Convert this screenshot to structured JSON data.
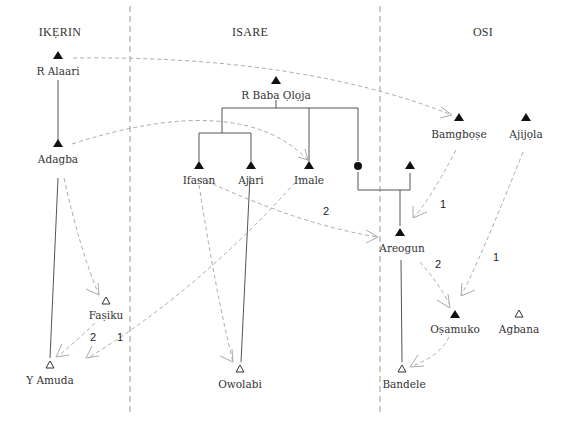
{
  "columns": [
    {
      "id": "ikerin",
      "label": "IKẸRIN"
    },
    {
      "id": "isare",
      "label": "ISARE"
    },
    {
      "id": "osi",
      "label": "OSI"
    }
  ],
  "nodes": [
    {
      "id": "r-alaari",
      "label": "R Alaari",
      "symbol": "filled-triangle",
      "column": "ikerin"
    },
    {
      "id": "adagba",
      "label": "Adagba",
      "symbol": "filled-triangle",
      "column": "ikerin"
    },
    {
      "id": "fasiku",
      "label": "Faṣiku",
      "symbol": "open-triangle",
      "column": "ikerin"
    },
    {
      "id": "y-amuda",
      "label": "Y Amuda",
      "symbol": "open-triangle",
      "column": "ikerin"
    },
    {
      "id": "r-baba-oloja",
      "label": "R Baba Ọlọja",
      "symbol": "filled-triangle",
      "column": "isare"
    },
    {
      "id": "ifasan",
      "label": "Ifasan",
      "symbol": "filled-triangle",
      "column": "isare"
    },
    {
      "id": "ajari",
      "label": "Ajari",
      "symbol": "filled-triangle",
      "column": "isare"
    },
    {
      "id": "imale",
      "label": "Imale",
      "symbol": "filled-triangle",
      "column": "isare"
    },
    {
      "id": "female",
      "label": "",
      "symbol": "filled-circle",
      "column": "isare"
    },
    {
      "id": "owolabi",
      "label": "Owolabi",
      "symbol": "open-triangle",
      "column": "isare"
    },
    {
      "id": "spouse",
      "label": "",
      "symbol": "filled-triangle",
      "column": "osi"
    },
    {
      "id": "bamgbose",
      "label": "Bamgbọṣe",
      "symbol": "filled-triangle",
      "column": "osi"
    },
    {
      "id": "ajijola",
      "label": "Ajijọla",
      "symbol": "filled-triangle",
      "column": "osi"
    },
    {
      "id": "areogun",
      "label": "Areogun",
      "symbol": "filled-triangle",
      "column": "osi"
    },
    {
      "id": "osamuko",
      "label": "Oṣamuko",
      "symbol": "filled-triangle",
      "column": "osi"
    },
    {
      "id": "agbana",
      "label": "Agbana",
      "symbol": "open-triangle",
      "column": "osi"
    },
    {
      "id": "bandele",
      "label": "Bandele",
      "symbol": "open-triangle",
      "column": "osi"
    }
  ],
  "kinship_links": [
    {
      "from": "r-alaari",
      "to": "adagba"
    },
    {
      "from": "adagba",
      "to": "y-amuda"
    },
    {
      "from": "r-baba-oloja",
      "to": "ifasan"
    },
    {
      "from": "r-baba-oloja",
      "to": "ajari"
    },
    {
      "from": "r-baba-oloja",
      "to": "imale"
    },
    {
      "from": "r-baba-oloja",
      "to": "female"
    },
    {
      "from": "ajari",
      "to": "owolabi"
    },
    {
      "from": "female",
      "to": "areogun"
    },
    {
      "from": "spouse",
      "to": "areogun"
    },
    {
      "from": "areogun",
      "to": "bandele"
    }
  ],
  "influence_links": [
    {
      "from": "r-alaari",
      "to": "bamgbose",
      "label": ""
    },
    {
      "from": "adagba",
      "to": "imale",
      "label": ""
    },
    {
      "from": "adagba",
      "to": "fasiku",
      "label": ""
    },
    {
      "from": "ifasan",
      "to": "areogun",
      "label": "2"
    },
    {
      "from": "ifasan",
      "to": "owolabi",
      "label": ""
    },
    {
      "from": "imale",
      "to": "y-amuda",
      "label": "1"
    },
    {
      "from": "fasiku",
      "to": "y-amuda",
      "label": "2"
    },
    {
      "from": "bamgbose",
      "to": "areogun",
      "label": "1"
    },
    {
      "from": "ajijola",
      "to": "osamuko",
      "label": "1"
    },
    {
      "from": "areogun",
      "to": "osamuko",
      "label": "2"
    },
    {
      "from": "osamuko",
      "to": "bandele",
      "label": ""
    }
  ]
}
